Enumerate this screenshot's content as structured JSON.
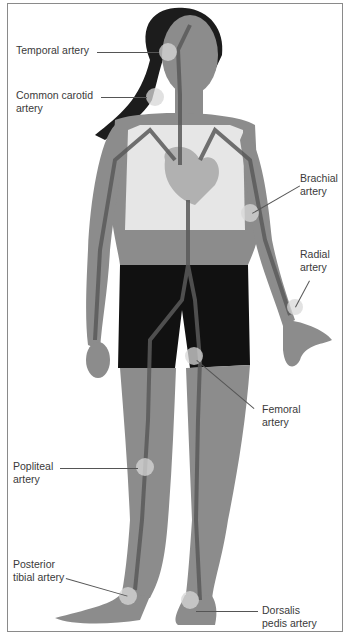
{
  "figure": {
    "colors": {
      "skin": "#8c8c8c",
      "skin_dark": "#6e6e6e",
      "hair": "#1c1c1c",
      "top": "#e6e6e6",
      "shorts": "#111111",
      "artery": "#5a5a5a",
      "pulse_point": "#d8d8d8",
      "frame_border": "#8a8a8a",
      "label_text": "#3a3a3a"
    }
  },
  "labels": [
    {
      "id": "temporal",
      "text": "Temporal artery"
    },
    {
      "id": "carotid",
      "text": "Common carotid\nartery"
    },
    {
      "id": "brachial",
      "text": "Brachial\nartery"
    },
    {
      "id": "radial",
      "text": "Radial\nartery"
    },
    {
      "id": "femoral",
      "text": "Femoral\nartery"
    },
    {
      "id": "popliteal",
      "text": "Popliteal\nartery"
    },
    {
      "id": "posterior_tibial",
      "text": "Posterior\ntibial artery"
    },
    {
      "id": "dorsalis_pedis",
      "text": "Dorsalis\npedis artery"
    }
  ]
}
